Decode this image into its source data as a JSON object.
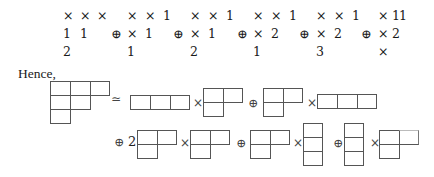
{
  "tableau_rows": [
    {
      "groups": [
        {
          "prefix": "",
          "cells": [
            "×",
            "×",
            "×"
          ]
        },
        {
          "prefix": "",
          "cells": [
            "×",
            "×",
            "1"
          ]
        },
        {
          "prefix": "",
          "cells": [
            "×",
            "×",
            "1"
          ]
        },
        {
          "prefix": "",
          "cells": [
            "×",
            "×",
            "1"
          ]
        },
        {
          "prefix": "",
          "cells": [
            "×",
            "×",
            "1"
          ]
        },
        {
          "prefix": "",
          "cells": [
            "×",
            "1",
            "1"
          ]
        }
      ]
    },
    {
      "groups": [
        {
          "prefix": "",
          "cells": [
            "1",
            "1"
          ]
        },
        {
          "prefix": "⊕",
          "cells": [
            "×",
            "1"
          ]
        },
        {
          "prefix": "⊕",
          "cells": [
            "×",
            "1"
          ]
        },
        {
          "prefix": "⊕",
          "cells": [
            "×",
            "2"
          ]
        },
        {
          "prefix": "⊕",
          "cells": [
            "×",
            "2"
          ]
        },
        {
          "prefix": "⊕",
          "cells": [
            "×",
            "2"
          ]
        }
      ]
    },
    {
      "groups": [
        {
          "prefix": "",
          "cells": [
            "2"
          ]
        },
        {
          "prefix": "",
          "cells": [
            "1"
          ]
        },
        {
          "prefix": "",
          "cells": [
            "2"
          ]
        },
        {
          "prefix": "",
          "cells": [
            "1"
          ]
        },
        {
          "prefix": "",
          "cells": [
            "3"
          ]
        },
        {
          "prefix": "",
          "cells": [
            "×"
          ]
        }
      ]
    }
  ],
  "text": {
    "hence": "Hence,",
    "simeq": "≃",
    "times": "×",
    "oplus": "⊕",
    "coef_two": "2"
  },
  "diagrams": {
    "lhs": [
      3,
      2,
      1
    ],
    "line1": [
      {
        "op_before": "≃",
        "left": [
          3
        ],
        "right": [
          2,
          1
        ]
      },
      {
        "op_before": "⊕",
        "left": [
          2,
          1
        ],
        "right": [
          3
        ]
      }
    ],
    "line2": [
      {
        "op_before": "⊕",
        "coef": "2",
        "left": [
          2,
          1
        ],
        "right": [
          2,
          1
        ]
      },
      {
        "op_before": "⊕",
        "left": [
          2,
          1
        ],
        "right": [
          1,
          1,
          1
        ]
      },
      {
        "op_before": "⊕",
        "left": [
          1,
          1,
          1
        ],
        "right": [
          2,
          1
        ]
      }
    ]
  }
}
